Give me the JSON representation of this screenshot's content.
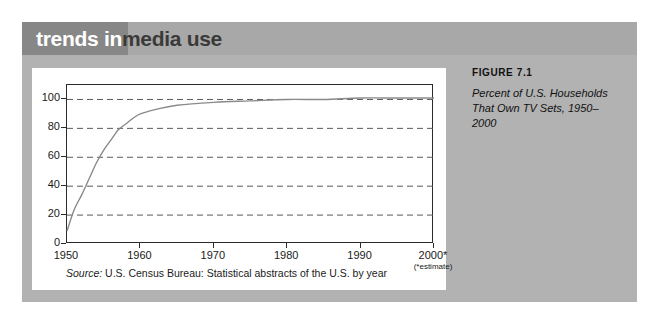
{
  "banner": {
    "text_light": "trends in",
    "text_dark": "media use"
  },
  "caption": {
    "figure_label": "FIGURE 7.1",
    "line1": "Percent of U.S. Households",
    "line2": "That Own TV Sets, 1950–2000"
  },
  "source": {
    "label": "Source:",
    "text": " U.S. Census Bureau: Statistical abstracts of the U.S. by year"
  },
  "footnote": {
    "estimate": "(*estimate)"
  },
  "colors": {
    "panel_gray": "#b2b2b2",
    "banner_gray": "#a8a8a8",
    "banner_dark_gray": "#878787",
    "card_white": "#ffffff",
    "axis_black": "#2b2b2b",
    "grid_gray": "#5a5a5a",
    "curve_gray": "#8a8a8a"
  },
  "chart_data": {
    "type": "line",
    "title": "Percent of U.S. Households That Own TV Sets, 1950–2000",
    "xlabel": "",
    "ylabel": "",
    "xlim": [
      1950,
      2000
    ],
    "ylim": [
      0,
      110
    ],
    "grid": true,
    "legend": "none",
    "ytick_labels": [
      "0",
      "20",
      "40",
      "60",
      "80",
      "100"
    ],
    "ytick_values": [
      0,
      20,
      40,
      60,
      80,
      100
    ],
    "xtick_labels": [
      "1950",
      "1960",
      "1970",
      "1980",
      "1990",
      "2000*"
    ],
    "xtick_values": [
      1950,
      1960,
      1970,
      1980,
      1990,
      2000
    ],
    "series": [
      {
        "name": "Percent of U.S. households that own TV sets",
        "x": [
          1950,
          1951,
          1952,
          1953,
          1954,
          1955,
          1956,
          1957,
          1958,
          1959,
          1960,
          1962,
          1965,
          1970,
          1975,
          1980,
          1985,
          1990,
          1995,
          2000
        ],
        "values": [
          9,
          24,
          34,
          45,
          56,
          65,
          72,
          79,
          83,
          87,
          90,
          93,
          96,
          98,
          99,
          100,
          100,
          101,
          101,
          101
        ]
      }
    ]
  }
}
